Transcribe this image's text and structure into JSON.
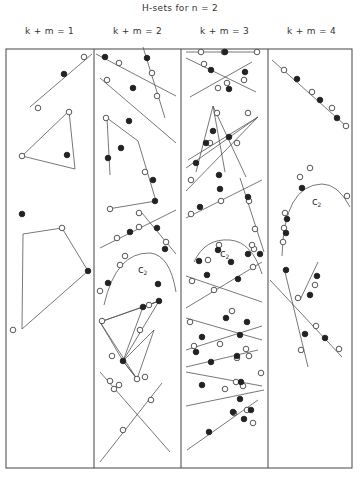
{
  "title": "H-sets for n = 2",
  "columns": [
    {
      "label": "k + m = 1",
      "x": 6
    },
    {
      "label": "k + m = 2",
      "x": 94
    },
    {
      "label": "k + m = 3",
      "x": 181
    },
    {
      "label": "k + m = 4",
      "x": 268
    }
  ],
  "frame": {
    "x": 6,
    "y": 49,
    "w": 346,
    "h": 419,
    "dividers": [
      94,
      181,
      268
    ]
  },
  "legend": {
    "open_point": "white circle",
    "filled_point": "black dot"
  },
  "figures": {
    "lines": [
      [
        30,
        107,
        92,
        54
      ],
      [
        96,
        54,
        176,
        96
      ],
      [
        143,
        47,
        165,
        118
      ],
      [
        100,
        78,
        176,
        143
      ],
      [
        107,
        118,
        110,
        175
      ],
      [
        107,
        118,
        138,
        141
      ],
      [
        138,
        141,
        156,
        201
      ],
      [
        108,
        209,
        156,
        201
      ],
      [
        100,
        248,
        176,
        210
      ],
      [
        142,
        213,
        176,
        254
      ],
      [
        186,
        52,
        256,
        52
      ],
      [
        186,
        58,
        256,
        92
      ],
      [
        190,
        97,
        252,
        62
      ],
      [
        186,
        168,
        258,
        117
      ],
      [
        188,
        160,
        258,
        117
      ],
      [
        186,
        191,
        258,
        117
      ],
      [
        213,
        106,
        196,
        172
      ],
      [
        213,
        106,
        246,
        177
      ],
      [
        213,
        106,
        225,
        172
      ],
      [
        186,
        218,
        262,
        180
      ],
      [
        240,
        178,
        264,
        252
      ],
      [
        186,
        276,
        262,
        302
      ],
      [
        186,
        308,
        262,
        262
      ],
      [
        186,
        318,
        262,
        340
      ],
      [
        186,
        350,
        262,
        326
      ],
      [
        186,
        367,
        258,
        350
      ],
      [
        186,
        372,
        262,
        386
      ],
      [
        186,
        406,
        264,
        390
      ],
      [
        187,
        450,
        258,
        400
      ],
      [
        272,
        60,
        346,
        126
      ],
      [
        300,
        300,
        318,
        262
      ],
      [
        270,
        280,
        342,
        357
      ],
      [
        285,
        272,
        308,
        367
      ],
      [
        100,
        372,
        170,
        452
      ],
      [
        100,
        462,
        162,
        383
      ]
    ],
    "polygons": [
      [
        [
          22,
          156
        ],
        [
          69,
          111
        ],
        [
          75,
          169
        ]
      ],
      [
        [
          22,
          329
        ],
        [
          23,
          234
        ],
        [
          62,
          228
        ],
        [
          88,
          271
        ]
      ],
      [
        [
          100,
          322
        ],
        [
          143,
          307
        ],
        [
          159,
          301
        ]
      ],
      [
        [
          100,
          322
        ],
        [
          123,
          361
        ],
        [
          137,
          379
        ]
      ],
      [
        [
          143,
          307
        ],
        [
          123,
          361
        ],
        [
          159,
          301
        ]
      ],
      [
        [
          123,
          361
        ],
        [
          154,
          330
        ],
        [
          137,
          379
        ]
      ]
    ],
    "curves": [
      "M104,305 Q116,252 150,253 Q170,255 176,292",
      "M194,262 Q205,238 230,240 Q252,242 262,274",
      "M282,256 Q284,185 322,184 Q338,184 350,207"
    ],
    "open_points": [
      [
        84,
        57
      ],
      [
        38,
        108
      ],
      [
        69,
        112
      ],
      [
        22,
        156
      ],
      [
        62,
        228
      ],
      [
        13,
        330
      ],
      [
        119,
        63
      ],
      [
        107,
        80
      ],
      [
        152,
        73
      ],
      [
        157,
        96
      ],
      [
        106,
        118
      ],
      [
        145,
        172
      ],
      [
        110,
        209
      ],
      [
        139,
        213
      ],
      [
        139,
        227
      ],
      [
        117,
        238
      ],
      [
        166,
        242
      ],
      [
        120,
        265
      ],
      [
        125,
        256
      ],
      [
        100,
        291
      ],
      [
        149,
        305
      ],
      [
        102,
        321
      ],
      [
        137,
        379
      ],
      [
        140,
        330
      ],
      [
        112,
        356
      ],
      [
        110,
        381
      ],
      [
        145,
        377
      ],
      [
        119,
        385
      ],
      [
        201,
        52
      ],
      [
        224,
        52
      ],
      [
        257,
        52
      ],
      [
        204,
        64
      ],
      [
        218,
        88
      ],
      [
        244,
        80
      ],
      [
        227,
        83
      ],
      [
        248,
        113
      ],
      [
        217,
        113
      ],
      [
        210,
        143
      ],
      [
        237,
        143
      ],
      [
        191,
        180
      ],
      [
        191,
        214
      ],
      [
        221,
        201
      ],
      [
        249,
        201
      ],
      [
        255,
        229
      ],
      [
        254,
        249
      ],
      [
        208,
        260
      ],
      [
        219,
        245
      ],
      [
        252,
        245
      ],
      [
        253,
        267
      ],
      [
        192,
        281
      ],
      [
        214,
        290
      ],
      [
        232,
        311
      ],
      [
        190,
        322
      ],
      [
        194,
        346
      ],
      [
        220,
        344
      ],
      [
        246,
        349
      ],
      [
        249,
        356
      ],
      [
        237,
        358
      ],
      [
        236,
        382
      ],
      [
        225,
        389
      ],
      [
        261,
        373
      ],
      [
        243,
        386
      ],
      [
        247,
        410
      ],
      [
        234,
        413
      ],
      [
        253,
        423
      ],
      [
        284,
        70
      ],
      [
        312,
        92
      ],
      [
        332,
        108
      ],
      [
        346,
        126
      ],
      [
        300,
        177
      ],
      [
        310,
        168
      ],
      [
        347,
        196
      ],
      [
        285,
        213
      ],
      [
        284,
        228
      ],
      [
        283,
        242
      ],
      [
        315,
        285
      ],
      [
        298,
        298
      ],
      [
        316,
        326
      ],
      [
        339,
        349
      ],
      [
        301,
        350
      ],
      [
        114,
        389
      ],
      [
        151,
        400
      ],
      [
        123,
        430
      ]
    ],
    "filled_points": [
      [
        64,
        74
      ],
      [
        67,
        155
      ],
      [
        22,
        214
      ],
      [
        88,
        271
      ],
      [
        105,
        57
      ],
      [
        147,
        58
      ],
      [
        133,
        88
      ],
      [
        129,
        121
      ],
      [
        121,
        148
      ],
      [
        153,
        180
      ],
      [
        108,
        158
      ],
      [
        155,
        201
      ],
      [
        130,
        232
      ],
      [
        157,
        228
      ],
      [
        158,
        284
      ],
      [
        165,
        249
      ],
      [
        108,
        283
      ],
      [
        143,
        307
      ],
      [
        159,
        301
      ],
      [
        123,
        361
      ],
      [
        225,
        52
      ],
      [
        211,
        70
      ],
      [
        245,
        72
      ],
      [
        229,
        89
      ],
      [
        213,
        131
      ],
      [
        229,
        137
      ],
      [
        196,
        163
      ],
      [
        219,
        175
      ],
      [
        206,
        143
      ],
      [
        200,
        207
      ],
      [
        220,
        189
      ],
      [
        248,
        197
      ],
      [
        231,
        262
      ],
      [
        238,
        279
      ],
      [
        218,
        250
      ],
      [
        248,
        254
      ],
      [
        199,
        261
      ],
      [
        260,
        254
      ],
      [
        207,
        275
      ],
      [
        226,
        318
      ],
      [
        247,
        322
      ],
      [
        202,
        337
      ],
      [
        240,
        335
      ],
      [
        211,
        362
      ],
      [
        237,
        356
      ],
      [
        202,
        385
      ],
      [
        196,
        352
      ],
      [
        241,
        382
      ],
      [
        251,
        410
      ],
      [
        240,
        399
      ],
      [
        244,
        419
      ],
      [
        209,
        432
      ],
      [
        233,
        412
      ],
      [
        297,
        79
      ],
      [
        320,
        100
      ],
      [
        337,
        118
      ],
      [
        302,
        188
      ],
      [
        287,
        219
      ],
      [
        286,
        233
      ],
      [
        317,
        276
      ],
      [
        286,
        270
      ],
      [
        310,
        295
      ],
      [
        305,
        334
      ],
      [
        325,
        338
      ]
    ],
    "labels": [
      {
        "text": "c",
        "sub": "2",
        "x": 138,
        "y": 273
      },
      {
        "text": "c",
        "sub": "2",
        "x": 220,
        "y": 257
      },
      {
        "text": "c",
        "sub": "2",
        "x": 312,
        "y": 205
      }
    ]
  }
}
